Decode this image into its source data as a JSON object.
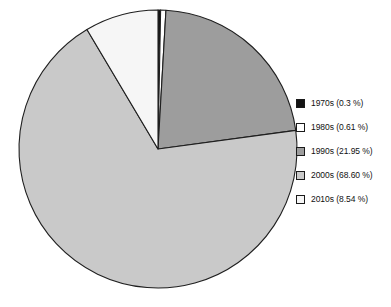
{
  "chart_data": {
    "type": "pie",
    "title": "",
    "categories": [
      "1970s",
      "1980s",
      "1990s",
      "2000s",
      "2010s"
    ],
    "values": [
      0.3,
      0.61,
      21.95,
      68.6,
      8.54
    ],
    "value_unit": "%",
    "legend_position": "right",
    "grid": false,
    "start_angle_deg": 0,
    "direction": "clockwise",
    "slices": [
      {
        "label": "1970s",
        "value": 0.3,
        "legend_text": "1970s (0.3 %)",
        "color": "#141414",
        "start_deg": 0,
        "end_deg": 1.08
      },
      {
        "label": "1980s",
        "value": 0.61,
        "legend_text": "1980s (0.61 %)",
        "color": "#ffffff",
        "start_deg": 1.08,
        "end_deg": 3.28
      },
      {
        "label": "1990s",
        "value": 21.95,
        "legend_text": "1990s (21.95 %)",
        "color": "#9d9d9d",
        "start_deg": 3.28,
        "end_deg": 82.3
      },
      {
        "label": "2000s",
        "value": 68.6,
        "legend_text": "2000s (68.60 %)",
        "color": "#c9c9c9",
        "start_deg": 82.3,
        "end_deg": 329.26
      },
      {
        "label": "2010s",
        "value": 8.54,
        "legend_text": "2010s (8.54 %)",
        "color": "#f6f6f6",
        "start_deg": 329.26,
        "end_deg": 360
      }
    ]
  },
  "legend": {
    "items": [
      {
        "label": "1970s (0.3 %)",
        "swatch": "#141414"
      },
      {
        "label": "1980s (0.61 %)",
        "swatch": "#ffffff"
      },
      {
        "label": "1990s (21.95 %)",
        "swatch": "#9d9d9d"
      },
      {
        "label": "2000s (68.60 %)",
        "swatch": "#c9c9c9"
      },
      {
        "label": "2010s (8.54 %)",
        "swatch": "#f6f6f6"
      }
    ]
  },
  "style": {
    "outline_color": "#1f1f1f",
    "background": "#ffffff",
    "center_x": 158,
    "center_y": 149,
    "radius": 139
  }
}
